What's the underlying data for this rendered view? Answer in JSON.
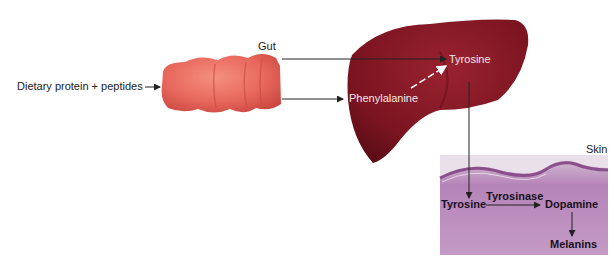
{
  "diagram": {
    "type": "metabolic-pathway",
    "labels": {
      "input": "Dietary protein + peptides",
      "gut": "Gut",
      "liver_phe": "Phenylalanine",
      "liver_tyr": "Tyrosine",
      "skin": "Skin",
      "skin_tyr": "Tyrosine",
      "enzyme": "Tyrosinase",
      "dopamine": "Dopamine",
      "melanins": "Melanins"
    },
    "nodes": [
      {
        "id": "input",
        "label": "Dietary protein + peptides"
      },
      {
        "id": "gut",
        "label": "Gut"
      },
      {
        "id": "phe",
        "label": "Phenylalanine",
        "organ": "Liver"
      },
      {
        "id": "tyr_liver",
        "label": "Tyrosine",
        "organ": "Liver"
      },
      {
        "id": "tyr_skin",
        "label": "Tyrosine",
        "organ": "Skin"
      },
      {
        "id": "dopamine",
        "label": "Dopamine",
        "organ": "Skin"
      },
      {
        "id": "melanins",
        "label": "Melanins",
        "organ": "Skin"
      }
    ],
    "edges": [
      {
        "from": "input",
        "to": "gut"
      },
      {
        "from": "gut",
        "to": "tyr_liver"
      },
      {
        "from": "gut",
        "to": "phe"
      },
      {
        "from": "phe",
        "to": "tyr_liver",
        "style": "dashed"
      },
      {
        "from": "tyr_liver",
        "to": "tyr_skin"
      },
      {
        "from": "tyr_skin",
        "to": "dopamine",
        "label": "Tyrosinase"
      },
      {
        "from": "dopamine",
        "to": "melanins"
      }
    ],
    "colors": {
      "gut": "#e8675c",
      "liver": "#7a1420",
      "skin": "#b87fb8"
    }
  }
}
